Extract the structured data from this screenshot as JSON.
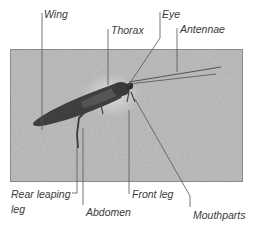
{
  "figure": {
    "photo_background": "#b4b4b4",
    "label_color": "#3a3a3a",
    "leader_line_color": "#555555"
  },
  "labels": {
    "wing": "Wing",
    "thorax": "Thorax",
    "eye": "Eye",
    "antennae": "Antennae",
    "rear_leaping_leg_line1": "Rear leaping",
    "rear_leaping_leg_line2": "leg",
    "abdomen": "Abdomen",
    "front_leg": "Front leg",
    "mouthparts": "Mouthparts"
  }
}
